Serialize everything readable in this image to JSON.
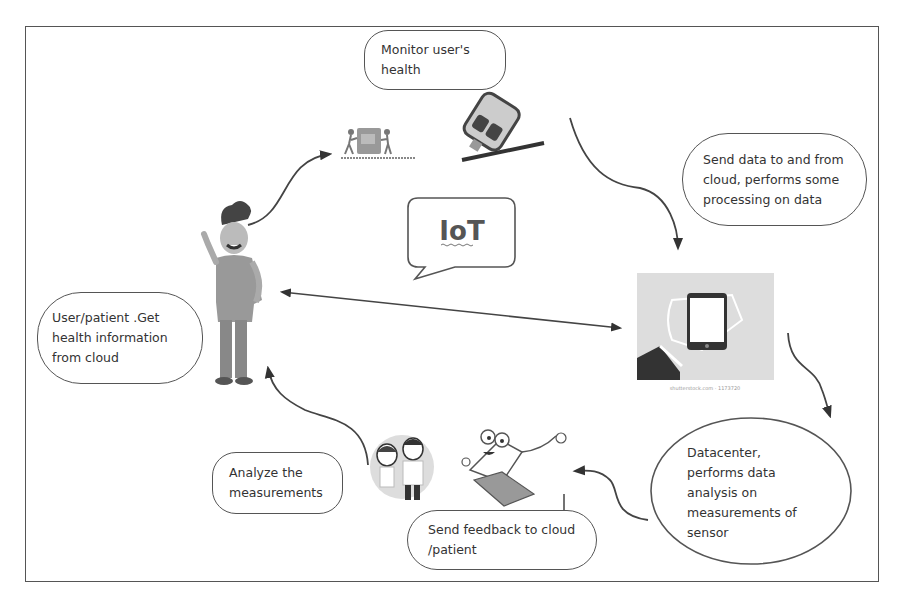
{
  "diagram": {
    "center_label": "IoT",
    "nodes": [
      {
        "id": "monitor",
        "text": "Monitor user's\nhealth"
      },
      {
        "id": "send_data",
        "text": "Send data to and from\ncloud, performs some\nprocessing on data"
      },
      {
        "id": "user",
        "text": "User/patient .Get\nhealth information\nfrom cloud"
      },
      {
        "id": "datacenter",
        "text": "Datacenter,\nperforms data\nanalysis on\nmeasurements of\nsensor"
      },
      {
        "id": "analyze",
        "text": "Analyze the\nmeasurements"
      },
      {
        "id": "feedback",
        "text": "Send feedback to cloud\n/patient"
      }
    ],
    "illustrations": [
      "user-character",
      "health-monitoring-device",
      "glucose-meter",
      "smartphone-in-hand",
      "doctors",
      "laptop-character"
    ],
    "phone_caption": "shutterstock.com · 1173720"
  }
}
